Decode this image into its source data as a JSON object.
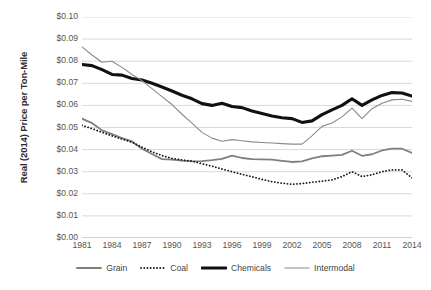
{
  "axes": {
    "y_title": "Real (2014) Price per Ton-Mile",
    "y_ticks": [
      "$0.10",
      "$0.09",
      "$0.08",
      "$0.07",
      "$0.06",
      "$0.05",
      "$0.04",
      "$0.03",
      "$0.02",
      "$0.01",
      "$0.00"
    ],
    "x_ticks": [
      "1981",
      "1984",
      "1987",
      "1990",
      "1993",
      "1996",
      "1999",
      "2002",
      "2005",
      "2008",
      "2011",
      "2014"
    ]
  },
  "legend": {
    "items": [
      {
        "label": "Grain",
        "swatch": "solid-gray-medium"
      },
      {
        "label": "Coal",
        "swatch": "dotted-black"
      },
      {
        "label": "Chemicals",
        "swatch": "solid-black-thick"
      },
      {
        "label": "Intermodal",
        "swatch": "solid-gray-thin"
      }
    ]
  },
  "chart_data": {
    "type": "line",
    "title": "",
    "xlabel": "",
    "ylabel": "Real (2014) Price per Ton-Mile",
    "xlim": [
      1981,
      2014
    ],
    "ylim": [
      0.0,
      0.1
    ],
    "ytick_step": 0.01,
    "xtick_step": 3,
    "grid": "horizontal",
    "legend_position": "bottom",
    "x": [
      1981,
      1982,
      1983,
      1984,
      1985,
      1986,
      1987,
      1988,
      1989,
      1990,
      1991,
      1992,
      1993,
      1994,
      1995,
      1996,
      1997,
      1998,
      1999,
      2000,
      2001,
      2002,
      2003,
      2004,
      2005,
      2006,
      2007,
      2008,
      2009,
      2010,
      2011,
      2012,
      2013,
      2014
    ],
    "series": [
      {
        "name": "Grain",
        "color": "#7f7f7f",
        "style": "solid",
        "width": 1.8,
        "values": [
          0.054,
          0.052,
          0.0487,
          0.047,
          0.0452,
          0.0437,
          0.0404,
          0.038,
          0.0357,
          0.0355,
          0.035,
          0.0347,
          0.0348,
          0.0352,
          0.0358,
          0.0373,
          0.0362,
          0.0357,
          0.0356,
          0.0355,
          0.0349,
          0.0344,
          0.0347,
          0.036,
          0.037,
          0.0373,
          0.0376,
          0.0395,
          0.0372,
          0.0379,
          0.0396,
          0.0404,
          0.0404,
          0.0385
        ]
      },
      {
        "name": "Coal",
        "color": "#1a1a1a",
        "style": "dotted",
        "width": 1.8,
        "values": [
          0.051,
          0.0495,
          0.0478,
          0.0462,
          0.0448,
          0.0433,
          0.0411,
          0.039,
          0.0373,
          0.036,
          0.0353,
          0.0348,
          0.0336,
          0.0325,
          0.0312,
          0.03,
          0.0288,
          0.0277,
          0.0265,
          0.0255,
          0.0248,
          0.0243,
          0.0246,
          0.0252,
          0.0257,
          0.0263,
          0.0278,
          0.03,
          0.0278,
          0.0286,
          0.03,
          0.0308,
          0.0308,
          0.0272
        ]
      },
      {
        "name": "Chemicals",
        "color": "#111111",
        "style": "solid",
        "width": 3.1,
        "values": [
          0.0785,
          0.078,
          0.0762,
          0.074,
          0.0737,
          0.0722,
          0.0715,
          0.07,
          0.0683,
          0.0665,
          0.0646,
          0.063,
          0.0608,
          0.06,
          0.061,
          0.0595,
          0.059,
          0.0575,
          0.0563,
          0.0552,
          0.0544,
          0.054,
          0.0523,
          0.053,
          0.0558,
          0.058,
          0.06,
          0.063,
          0.06,
          0.0625,
          0.0645,
          0.0658,
          0.0656,
          0.0642
        ]
      },
      {
        "name": "Intermodal",
        "color": "#8a8a8a",
        "style": "solid",
        "width": 1.1,
        "values": [
          0.0865,
          0.0828,
          0.0795,
          0.08,
          0.0772,
          0.074,
          0.0712,
          0.0676,
          0.064,
          0.0604,
          0.056,
          0.052,
          0.0478,
          0.0452,
          0.0438,
          0.0445,
          0.044,
          0.0435,
          0.0432,
          0.043,
          0.0427,
          0.0425,
          0.0425,
          0.0462,
          0.0505,
          0.052,
          0.0548,
          0.0588,
          0.054,
          0.0585,
          0.061,
          0.0625,
          0.0628,
          0.0618
        ]
      }
    ]
  }
}
